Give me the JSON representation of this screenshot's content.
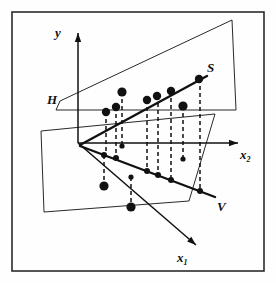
{
  "figure": {
    "kind": "3d-scatter-regression-diagram",
    "background_color": "#fefefe",
    "ink_color": "#111111",
    "border_color": "#2b2b2b",
    "frame": {
      "x": 12,
      "y": 12,
      "width": 252,
      "height": 259
    }
  },
  "labels": {
    "y_axis": "y",
    "x1_axis": "x",
    "x1_sub": "1",
    "x2_axis": "x",
    "x2_sub": "2",
    "plane_H": "H",
    "line_S": "S",
    "line_V": "V"
  },
  "chart_data": {
    "type": "scatter",
    "title": "",
    "xlabel": "x_1, x_2",
    "ylabel": "y",
    "grid": false,
    "legend": "none",
    "axes": [
      {
        "name": "y",
        "from": [
          78,
          143
        ],
        "to": [
          78,
          33
        ],
        "arrow": true
      },
      {
        "name": "x2",
        "from": [
          78,
          143
        ],
        "to": [
          238,
          143
        ],
        "arrow": true
      },
      {
        "name": "x1",
        "from": [
          78,
          143
        ],
        "to": [
          196,
          245
        ],
        "arrow": true
      }
    ],
    "planes": [
      {
        "name": "H",
        "points": "60,101 232,20 236,110 56,110",
        "note": "slanted plane through origin"
      },
      {
        "name": "V",
        "points": "41,131 215,114 189,201 44,212",
        "note": "lower oblique plane"
      }
    ],
    "series": [
      {
        "name": "S",
        "role": "upper fitted line",
        "line": {
          "from": [
            80,
            145
          ],
          "to": [
            207,
            76
          ]
        },
        "label_at": [
          211,
          70
        ],
        "marker": "large-filled-circle",
        "points": [
          {
            "x": 106,
            "y": 112
          },
          {
            "x": 116,
            "y": 107
          },
          {
            "x": 147,
            "y": 100
          },
          {
            "x": 157,
            "y": 96
          },
          {
            "x": 171,
            "y": 91
          },
          {
            "x": 199,
            "y": 79
          }
        ]
      },
      {
        "name": "V",
        "role": "lower fitted line",
        "line": {
          "from": [
            80,
            146
          ],
          "to": [
            215,
            197
          ]
        },
        "label_at": [
          221,
          207
        ],
        "marker": "small-filled-circle",
        "points": [
          {
            "x": 104,
            "y": 155
          },
          {
            "x": 116,
            "y": 158
          },
          {
            "x": 147,
            "y": 171
          },
          {
            "x": 158,
            "y": 175
          },
          {
            "x": 171,
            "y": 180
          },
          {
            "x": 200,
            "y": 191
          }
        ]
      },
      {
        "name": "observations",
        "role": "off-line scatter points",
        "points": [
          {
            "x": 122,
            "y": 92,
            "size": "large"
          },
          {
            "x": 122,
            "y": 146,
            "size": "small"
          },
          {
            "x": 183,
            "y": 106,
            "size": "large"
          },
          {
            "x": 183,
            "y": 159,
            "size": "small"
          },
          {
            "x": 104,
            "y": 186,
            "size": "large"
          },
          {
            "x": 131,
            "y": 177,
            "size": "small"
          },
          {
            "x": 131,
            "y": 207,
            "size": "large"
          }
        ]
      }
    ],
    "connectors": {
      "style": "dashed-vertical",
      "pairs": [
        {
          "x": 106,
          "y_top": 112,
          "y_bottom": 155
        },
        {
          "x": 116,
          "y_top": 107,
          "y_bottom": 158
        },
        {
          "x": 122,
          "y_top": 92,
          "y_bottom": 146
        },
        {
          "x": 147,
          "y_top": 100,
          "y_bottom": 171
        },
        {
          "x": 158,
          "y_top": 96,
          "y_bottom": 175
        },
        {
          "x": 171,
          "y_top": 91,
          "y_bottom": 180
        },
        {
          "x": 183,
          "y_top": 106,
          "y_bottom": 159
        },
        {
          "x": 200,
          "y_top": 79,
          "y_bottom": 191
        },
        {
          "x": 104,
          "y_top": 155,
          "y_bottom": 186
        },
        {
          "x": 131,
          "y_top": 177,
          "y_bottom": 207
        }
      ]
    }
  }
}
